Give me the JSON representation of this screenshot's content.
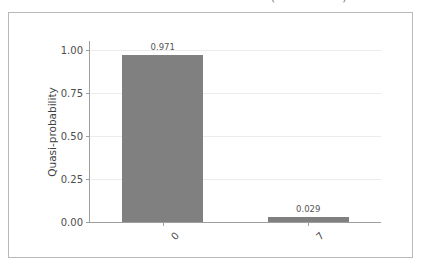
{
  "top_strip": {
    "clipped_text": "—   ——   ———   —   —————  —— ——— ———— (—— — — —)"
  },
  "figure": {
    "background_color": "#ffffff",
    "border_color": "#b9b9b9",
    "axis_color": "#9e9e9e",
    "grid_color": "#ececec",
    "bar_color": "#808080"
  },
  "chart_data": {
    "type": "bar",
    "title": "",
    "xlabel": "",
    "ylabel": "Quasi-probability",
    "categories": [
      "0",
      "7"
    ],
    "values": [
      0.971,
      0.029
    ],
    "value_labels": [
      "0.971",
      "0.029"
    ],
    "ylim": [
      0.0,
      1.05
    ],
    "yticks": [
      0.0,
      0.25,
      0.5,
      0.75,
      1.0
    ],
    "ytick_labels": [
      "0.00",
      "0.25",
      "0.50",
      "0.75",
      "1.00"
    ],
    "xtick_labels": [
      "0",
      "7"
    ],
    "xtick_rotation": -45,
    "grid": true,
    "grid_axis": "y",
    "legend": false,
    "series": [
      {
        "name": "Quasi-probability",
        "values": [
          0.971,
          0.029
        ]
      }
    ]
  }
}
